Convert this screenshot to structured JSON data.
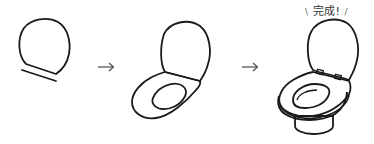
{
  "diagram": {
    "steps": [
      {
        "id": 1,
        "label": "lid-only"
      },
      {
        "id": 2,
        "label": "lid-and-seat"
      },
      {
        "id": 3,
        "label": "complete-toilet"
      }
    ],
    "arrows": [
      "→",
      "→"
    ],
    "done_label": {
      "left_mark": "\\",
      "text": "完成!",
      "right_mark": "/"
    },
    "colors": {
      "stroke": "#1a1a1a",
      "background": "#ffffff",
      "arrow": "#555555",
      "label": "#333333"
    }
  }
}
